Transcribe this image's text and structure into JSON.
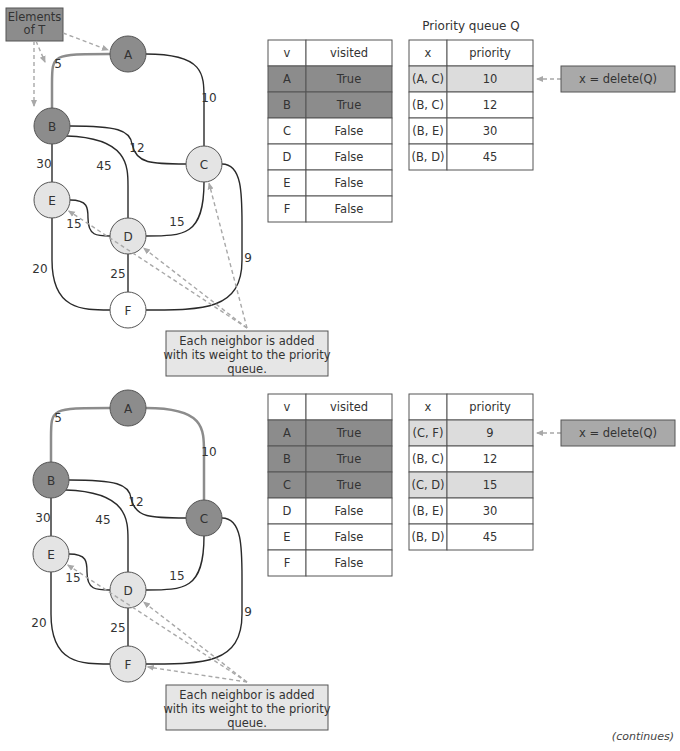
{
  "colors": {
    "visited_node": "#8c8c8c",
    "frontier_node": "#e4e4e4",
    "unvisited_node": "#ffffff",
    "tree_edge": "#8c8c8c",
    "edge": "#2a2a2a",
    "table_visited_fill": "#8c8c8c",
    "queue_highlight_fill": "#dcdcdc",
    "delete_box_fill": "#a9a9a9",
    "note_box_fill": "#e6e6e6",
    "elements_box_fill": "#8c8c8c",
    "dashed_arrow": "#a8a8a8"
  },
  "panels": [
    {
      "id": "step1",
      "offset_y": 0,
      "elements_label": [
        "Elements",
        "of T"
      ],
      "nodes": [
        {
          "id": "A",
          "x": 128,
          "y": 54,
          "state": "visited"
        },
        {
          "id": "B",
          "x": 52,
          "y": 126,
          "state": "visited"
        },
        {
          "id": "C",
          "x": 204,
          "y": 164,
          "state": "frontier"
        },
        {
          "id": "D",
          "x": 128,
          "y": 236,
          "state": "frontier"
        },
        {
          "id": "E",
          "x": 52,
          "y": 200,
          "state": "frontier"
        },
        {
          "id": "F",
          "x": 128,
          "y": 310,
          "state": "unvisited"
        }
      ],
      "edges": [
        {
          "from": "A",
          "to": "B",
          "weight": "5",
          "tree": true
        },
        {
          "from": "A",
          "to": "C",
          "weight": "10",
          "tree": false
        },
        {
          "from": "B",
          "to": "C",
          "weight": "12",
          "tree": false
        },
        {
          "from": "B",
          "to": "D",
          "weight": "45",
          "tree": false
        },
        {
          "from": "B",
          "to": "E",
          "weight": "30",
          "tree": false
        },
        {
          "from": "E",
          "to": "D",
          "weight": "15",
          "tree": false
        },
        {
          "from": "C",
          "to": "D",
          "weight": "15",
          "tree": false
        },
        {
          "from": "E",
          "to": "F",
          "weight": "20",
          "tree": false
        },
        {
          "from": "D",
          "to": "F",
          "weight": "25",
          "tree": false
        },
        {
          "from": "C",
          "to": "F",
          "weight": "9",
          "tree": false
        }
      ],
      "visited_table": {
        "headers": [
          "v",
          "visited"
        ],
        "rows": [
          {
            "v": "A",
            "visited": "True",
            "highlight": true
          },
          {
            "v": "B",
            "visited": "True",
            "highlight": true
          },
          {
            "v": "C",
            "visited": "False",
            "highlight": false
          },
          {
            "v": "D",
            "visited": "False",
            "highlight": false
          },
          {
            "v": "E",
            "visited": "False",
            "highlight": false
          },
          {
            "v": "F",
            "visited": "False",
            "highlight": false
          }
        ]
      },
      "queue_title": "Priority queue Q",
      "queue_table": {
        "headers": [
          "x",
          "priority"
        ],
        "rows": [
          {
            "x": "(A, C)",
            "priority": "10",
            "highlight": true
          },
          {
            "x": "(B, C)",
            "priority": "12",
            "highlight": false
          },
          {
            "x": "(B, E)",
            "priority": "30",
            "highlight": false
          },
          {
            "x": "(B, D)",
            "priority": "45",
            "highlight": false
          }
        ]
      },
      "delete_label": "x = delete(Q)",
      "note_lines": [
        "Each neighbor is added",
        "with its weight to the priority",
        "queue."
      ],
      "note_targets": [
        "E",
        "D",
        "C"
      ]
    },
    {
      "id": "step2",
      "offset_y": 354,
      "elements_label": null,
      "nodes": [
        {
          "id": "A",
          "x": 128,
          "y": 54,
          "state": "visited"
        },
        {
          "id": "B",
          "x": 51,
          "y": 126,
          "state": "visited"
        },
        {
          "id": "C",
          "x": 204,
          "y": 164,
          "state": "visited"
        },
        {
          "id": "D",
          "x": 128,
          "y": 236,
          "state": "frontier"
        },
        {
          "id": "E",
          "x": 51,
          "y": 200,
          "state": "frontier"
        },
        {
          "id": "F",
          "x": 128,
          "y": 310,
          "state": "frontier"
        }
      ],
      "edges": [
        {
          "from": "A",
          "to": "B",
          "weight": "5",
          "tree": true
        },
        {
          "from": "A",
          "to": "C",
          "weight": "10",
          "tree": true
        },
        {
          "from": "B",
          "to": "C",
          "weight": "12",
          "tree": false
        },
        {
          "from": "B",
          "to": "D",
          "weight": "45",
          "tree": false
        },
        {
          "from": "B",
          "to": "E",
          "weight": "30",
          "tree": false
        },
        {
          "from": "E",
          "to": "D",
          "weight": "15",
          "tree": false
        },
        {
          "from": "C",
          "to": "D",
          "weight": "15",
          "tree": false
        },
        {
          "from": "E",
          "to": "F",
          "weight": "20",
          "tree": false
        },
        {
          "from": "D",
          "to": "F",
          "weight": "25",
          "tree": false
        },
        {
          "from": "C",
          "to": "F",
          "weight": "9",
          "tree": false
        }
      ],
      "visited_table": {
        "headers": [
          "v",
          "visited"
        ],
        "rows": [
          {
            "v": "A",
            "visited": "True",
            "highlight": true
          },
          {
            "v": "B",
            "visited": "True",
            "highlight": true
          },
          {
            "v": "C",
            "visited": "True",
            "highlight": true
          },
          {
            "v": "D",
            "visited": "False",
            "highlight": false
          },
          {
            "v": "E",
            "visited": "False",
            "highlight": false
          },
          {
            "v": "F",
            "visited": "False",
            "highlight": false
          }
        ]
      },
      "queue_title": null,
      "queue_table": {
        "headers": [
          "x",
          "priority"
        ],
        "rows": [
          {
            "x": "(C, F)",
            "priority": "9",
            "highlight": true
          },
          {
            "x": "(B, C)",
            "priority": "12",
            "highlight": false
          },
          {
            "x": "(C, D)",
            "priority": "15",
            "highlight": true
          },
          {
            "x": "(B, E)",
            "priority": "30",
            "highlight": false
          },
          {
            "x": "(B, D)",
            "priority": "45",
            "highlight": false
          }
        ]
      },
      "delete_label": "x = delete(Q)",
      "note_lines": [
        "Each neighbor is added",
        "with its weight to the priority",
        "queue."
      ],
      "note_targets": [
        "E",
        "D",
        "F"
      ]
    }
  ],
  "footer": {
    "continues": "(continues)"
  }
}
